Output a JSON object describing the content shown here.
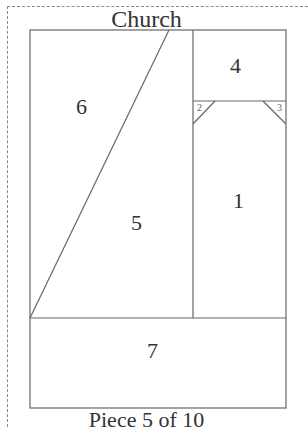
{
  "title": "Church",
  "footer": "Piece 5 of 10",
  "pieces": [
    {
      "id": "1",
      "label": "1"
    },
    {
      "id": "2",
      "label": "2"
    },
    {
      "id": "3",
      "label": "3"
    },
    {
      "id": "4",
      "label": "4"
    },
    {
      "id": "5",
      "label": "5"
    },
    {
      "id": "6",
      "label": "6"
    },
    {
      "id": "7",
      "label": "7"
    }
  ],
  "colors": {
    "line": "#666666",
    "text": "#333333",
    "dashed": "#888888"
  }
}
